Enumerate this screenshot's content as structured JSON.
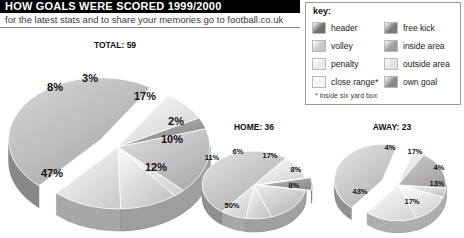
{
  "header": {
    "title": "HOW GOALS WERE SCORED 1999/2000",
    "subtitle": "for the latest stats and to share your memories go to football.co.uk"
  },
  "legend": {
    "title": "key:",
    "footnote": "* inside six yard box",
    "items": [
      {
        "label": "header",
        "color": "#6f6f6f"
      },
      {
        "label": "free kick",
        "color": "#7a7a7a"
      },
      {
        "label": "volley",
        "color": "#c9c9c9"
      },
      {
        "label": "inside area",
        "color": "#9c9c9c"
      },
      {
        "label": "penalty",
        "color": "#ededed"
      },
      {
        "label": "outside area",
        "color": "#e2e2e2"
      },
      {
        "label": "close range*",
        "color": "#f4f4f4"
      },
      {
        "label": "own goal",
        "color": "#8a8a8a"
      }
    ]
  },
  "chart_data": [
    {
      "type": "pie",
      "title": "TOTAL: 59",
      "name": "total",
      "categories": [
        "close range*",
        "header",
        "volley",
        "penalty",
        "free kick",
        "inside area",
        "own goal"
      ],
      "values": [
        47,
        8,
        3,
        17,
        2,
        10,
        12
      ],
      "labels": [
        "47%",
        "8%",
        "3%",
        "17%",
        "2%",
        "10%",
        "12%"
      ],
      "colors": [
        "#bdbdbd",
        "#ececec",
        "#9d9d9d",
        "#c4c4c4",
        "#ededed",
        "#dcdcdc",
        "#e8e8e8"
      ],
      "legend": "external",
      "grid": false
    },
    {
      "type": "pie",
      "title": "HOME: 36",
      "name": "home",
      "categories": [
        "close range*",
        "header",
        "volley",
        "penalty",
        "free kick",
        "inside area"
      ],
      "values": [
        50,
        11,
        6,
        17,
        8,
        8
      ],
      "labels": [
        "50%",
        "11%",
        "6%",
        "17%",
        "8%",
        "8%"
      ],
      "colors": [
        "#c6c6c6",
        "#efefef",
        "#9f9f9f",
        "#cfcfcf",
        "#dedede",
        "#e8e8e8"
      ],
      "legend": "external",
      "grid": false
    },
    {
      "type": "pie",
      "title": "AWAY: 23",
      "name": "away",
      "categories": [
        "close range*",
        "header",
        "volley",
        "penalty",
        "free kick",
        "inside area"
      ],
      "values": [
        43,
        4,
        17,
        4,
        13,
        17
      ],
      "labels": [
        "43%",
        "4%",
        "17%",
        "4%",
        "13%",
        "17%"
      ],
      "colors": [
        "#c9c9c9",
        "#efefef",
        "#b6b6b6",
        "#dcdcdc",
        "#ebebeb",
        "#f2f2f2"
      ],
      "legend": "external",
      "grid": false
    }
  ]
}
